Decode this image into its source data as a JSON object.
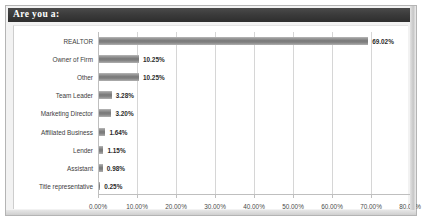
{
  "panel": {
    "title": "Are you a:"
  },
  "chart_data": {
    "type": "bar",
    "orientation": "horizontal",
    "title": "Are you a:",
    "xlabel": "",
    "ylabel": "",
    "xlim": [
      0,
      80
    ],
    "grid": true,
    "legend": false,
    "tick_labels": [
      "0.00%",
      "10.00%",
      "20.00%",
      "30.00%",
      "40.00%",
      "50.00%",
      "60.00%",
      "70.00%",
      "80.00%"
    ],
    "tick_values": [
      0,
      10,
      20,
      30,
      40,
      50,
      60,
      70,
      80
    ],
    "categories": [
      "REALTOR",
      "Owner of Firm",
      "Other",
      "Team Leader",
      "Marketing Director",
      "Affiliated Business",
      "Lender",
      "Assistant",
      "Title representative"
    ],
    "values": [
      69.02,
      10.25,
      10.25,
      3.28,
      3.2,
      1.64,
      1.15,
      0.98,
      0.25
    ],
    "data_labels": [
      "69.02%",
      "10.25%",
      "10.25%",
      "3.28%",
      "3.20%",
      "1.64%",
      "1.15%",
      "0.98%",
      "0.25%"
    ],
    "bar_color": "#8a8a8a",
    "accent_color": "#3a3a3a"
  }
}
